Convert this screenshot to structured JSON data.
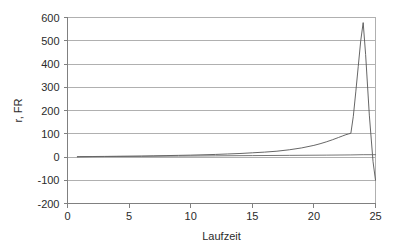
{
  "chart_data": {
    "type": "line",
    "title": "",
    "subtitle": "",
    "xlabel": "Laufzeit",
    "ylabel": "r, FR",
    "xlim": [
      0,
      25
    ],
    "ylim": [
      -200,
      600
    ],
    "xticks": [
      0,
      5,
      10,
      15,
      20,
      25
    ],
    "yticks": [
      -200,
      -100,
      0,
      100,
      200,
      300,
      400,
      500,
      600
    ],
    "xtick_labels": [
      "0",
      "5",
      "10",
      "15",
      "20",
      "25"
    ],
    "ytick_labels": [
      "-200",
      "-100",
      "0",
      "100",
      "200",
      "300",
      "400",
      "500",
      "600"
    ],
    "grid": true,
    "grid_axis": "y",
    "legend": false,
    "legend_position": "none",
    "colors": {
      "line": "#555555",
      "baseline": "#666666",
      "grid": "#b0b0b0",
      "axis": "#808080",
      "text": "#2b2b2b",
      "background": "#ffffff"
    },
    "series": [
      {
        "name": "r",
        "color": "#555555",
        "x": [
          0.8,
          1,
          2,
          3,
          4,
          5,
          6,
          7,
          8,
          9,
          10,
          11,
          12,
          13,
          14,
          15,
          16,
          17,
          18,
          19,
          20,
          20.5,
          21,
          21.5,
          22,
          22.3,
          22.6,
          22.8,
          23,
          23.2,
          23.4,
          23.6,
          23.8,
          24,
          24.2,
          24.5,
          24.8,
          25
        ],
        "values": [
          1,
          1.5,
          2,
          2.5,
          3,
          3.5,
          4,
          5,
          6,
          7,
          8,
          9.5,
          11,
          13,
          15,
          18,
          21,
          25,
          31,
          39,
          50,
          57,
          65,
          74,
          84,
          90,
          96,
          99,
          102,
          175,
          280,
          390,
          500,
          578,
          440,
          180,
          -20,
          -100
        ]
      },
      {
        "name": "FR",
        "color": "#666666",
        "x": [
          0.8,
          3,
          6,
          9,
          12,
          15,
          18,
          21,
          23,
          24,
          25
        ],
        "values": [
          1,
          2,
          3,
          4,
          5,
          6,
          7,
          8,
          9,
          10,
          10
        ]
      }
    ],
    "annotations": [],
    "peak": {
      "x": 24,
      "value": 578
    },
    "end_value": -100
  }
}
